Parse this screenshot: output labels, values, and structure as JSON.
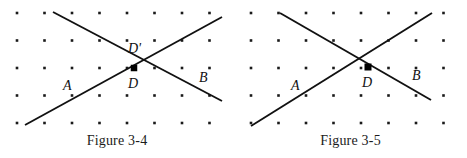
{
  "page": {
    "width": 467,
    "height": 158,
    "background_color": "#ffffff",
    "ink_color": "#111111",
    "dot_color": "#1a1a1a"
  },
  "figures": [
    {
      "id": "figure-3-4",
      "caption": "Figure 3-4",
      "origin_x": 0,
      "width": 234,
      "grid": {
        "start_x": 17,
        "start_y": 13,
        "step_x": 27.5,
        "step_y": 27.5,
        "cols": 8,
        "rows": 5,
        "dot_size": 2.6
      },
      "lines": [
        {
          "name": "descending-line",
          "x1": 53,
          "y1": 12,
          "x2": 222,
          "y2": 101
        },
        {
          "name": "ascending-line",
          "x1": 25,
          "y1": 125,
          "x2": 222,
          "y2": 17
        }
      ],
      "intersection": {
        "x": 139,
        "y": 58
      },
      "marker": {
        "name": "point-d-marker",
        "x": 134,
        "y": 68,
        "size": 6.5
      },
      "labels": [
        {
          "name": "label-d-prime",
          "text": "D'",
          "x": 128,
          "y": 53
        },
        {
          "name": "label-d",
          "text": "D",
          "x": 128,
          "y": 88
        },
        {
          "name": "label-a",
          "text": "A",
          "x": 63,
          "y": 90
        },
        {
          "name": "label-b",
          "text": "B",
          "x": 199,
          "y": 82
        }
      ]
    },
    {
      "id": "figure-3-5",
      "caption": "Figure 3-5",
      "origin_x": 234,
      "width": 233,
      "grid": {
        "start_x": 17,
        "start_y": 13,
        "step_x": 27.5,
        "step_y": 27.5,
        "cols": 8,
        "rows": 5,
        "dot_size": 2.6
      },
      "lines": [
        {
          "name": "descending-line",
          "x1": 46,
          "y1": 13,
          "x2": 197,
          "y2": 100
        },
        {
          "name": "ascending-line",
          "x1": 17,
          "y1": 126,
          "x2": 198,
          "y2": 13
        }
      ],
      "intersection": {
        "x": 134,
        "y": 67
      },
      "marker": {
        "name": "point-d-marker",
        "x": 134,
        "y": 67,
        "size": 7
      },
      "labels": [
        {
          "name": "label-d",
          "text": "D",
          "x": 128,
          "y": 87
        },
        {
          "name": "label-a",
          "text": "A",
          "x": 57,
          "y": 90
        },
        {
          "name": "label-b",
          "text": "B",
          "x": 178,
          "y": 80
        }
      ]
    }
  ]
}
